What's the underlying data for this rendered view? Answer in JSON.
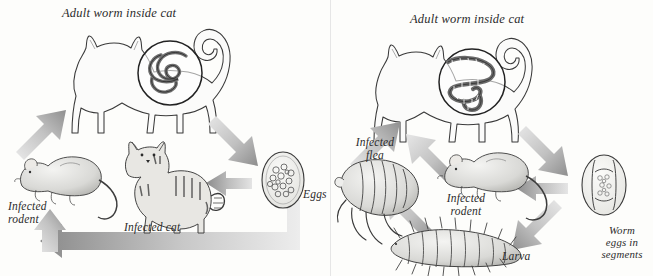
{
  "figure": {
    "background_color": "#fdfdfb",
    "ink_color": "#2b2b2b",
    "arrow_color": "#a9a9a9"
  },
  "panels": [
    {
      "id": "roundworm-cycle",
      "name": "Roundworm (Toxocara) life cycle",
      "labels": {
        "top": "Adult worm inside cat",
        "rodent": "Infected\nrodent",
        "cat": "Infected cat",
        "eggs": "Eggs"
      },
      "stages": [
        {
          "name": "adult-worm-inside-cat",
          "label": "Adult worm inside cat"
        },
        {
          "name": "infected-rodent",
          "label": "Infected rodent"
        },
        {
          "name": "infected-cat",
          "label": "Infected cat"
        },
        {
          "name": "eggs",
          "label": "Eggs"
        }
      ],
      "arrows": [
        {
          "from": "infected-rodent",
          "to": "adult-worm-inside-cat",
          "direction": "up-right"
        },
        {
          "from": "adult-worm-inside-cat",
          "to": "eggs",
          "direction": "down-right"
        },
        {
          "from": "eggs",
          "to": "infected-cat",
          "direction": "left"
        },
        {
          "from": "eggs",
          "to": "infected-rodent",
          "direction": "left-then-up"
        }
      ]
    },
    {
      "id": "tapeworm-cycle",
      "name": "Tapeworm (Dipylidium) life cycle",
      "labels": {
        "top": "Adult worm inside cat",
        "flea": "Infected\nflea",
        "rodent": "Infected\nrodent",
        "larva": "Larva",
        "eggs": "Worm\neggs in\nsegments"
      },
      "stages": [
        {
          "name": "adult-worm-inside-cat",
          "label": "Adult worm inside cat"
        },
        {
          "name": "infected-flea",
          "label": "Infected flea"
        },
        {
          "name": "infected-rodent",
          "label": "Infected rodent"
        },
        {
          "name": "larva",
          "label": "Larva"
        },
        {
          "name": "worm-eggs-in-segments",
          "label": "Worm eggs in segments"
        }
      ],
      "arrows": [
        {
          "from": "infected-flea",
          "to": "adult-worm-inside-cat",
          "direction": "up-right"
        },
        {
          "from": "infected-rodent",
          "to": "adult-worm-inside-cat",
          "direction": "up-left"
        },
        {
          "from": "adult-worm-inside-cat",
          "to": "worm-eggs-in-segments",
          "direction": "down-right"
        },
        {
          "from": "worm-eggs-in-segments",
          "to": "infected-rodent",
          "direction": "left"
        },
        {
          "from": "worm-eggs-in-segments",
          "to": "larva",
          "direction": "down-left"
        },
        {
          "from": "larva",
          "to": "infected-flea",
          "direction": "up-left"
        }
      ]
    }
  ]
}
